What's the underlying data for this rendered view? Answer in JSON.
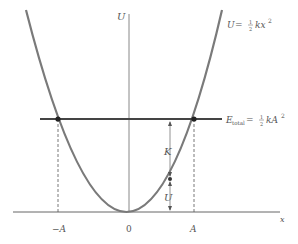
{
  "diagram": {
    "type": "potential-energy-parabola",
    "axes": {
      "y_label": "U",
      "x_label": "x",
      "x_ticks": [
        "−A",
        "0",
        "A"
      ]
    },
    "curve_label": {
      "lhs": "U",
      "eq": " = ",
      "frac_num": "1",
      "frac_den": "2",
      "rhs": "kx",
      "exp": "2"
    },
    "energy_label": {
      "lhs": "E",
      "sub": "total",
      "eq": " = ",
      "frac_num": "1",
      "frac_den": "2",
      "rhs": "kA",
      "exp": "2"
    },
    "arrows": {
      "kinetic": "K",
      "potential": "U"
    },
    "colors": {
      "curve": "#7a7a7a",
      "energy_line": "#444444",
      "axis": "#666666",
      "text": "#555555"
    }
  }
}
